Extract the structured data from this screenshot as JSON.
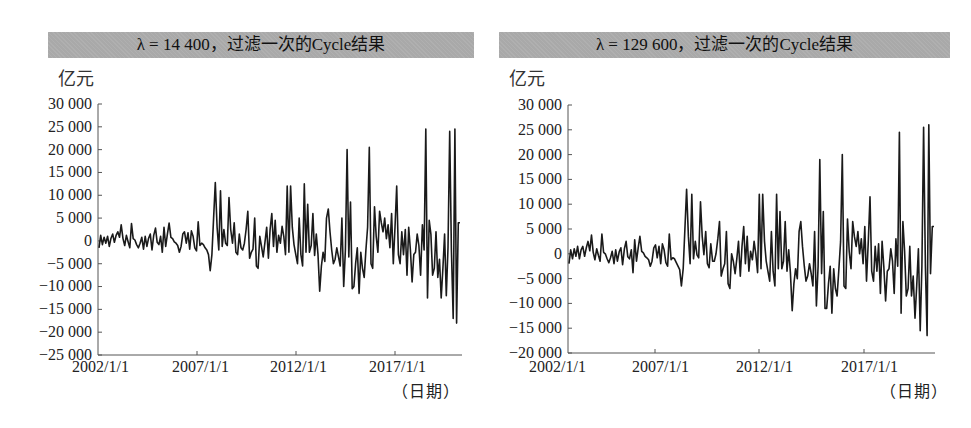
{
  "chart_data": [
    {
      "type": "line",
      "title": "λ = 14 400，过滤一次的Cycle结果",
      "ylabel": "亿元",
      "xlabel": "（日期）",
      "ylim": [
        -25000,
        30000
      ],
      "yticks": [
        30000,
        25000,
        20000,
        15000,
        10000,
        5000,
        0,
        -5000,
        -10000,
        -15000,
        -20000,
        -25000
      ],
      "ytick_labels": [
        "30 000",
        "25 000",
        "20 000",
        "15 000",
        "10 000",
        "5 000",
        "0",
        "−5 000",
        "−10 000",
        "−15 000",
        "−20 000",
        "−25 000"
      ],
      "xtick_labels": [
        "2002/1/1",
        "2007/1/1",
        "2012/1/1",
        "2017/1/1"
      ],
      "grid": false,
      "legend": null,
      "series": [
        {
          "name": "Cycle",
          "x_start": "2002/1/1",
          "x_step": "1 month",
          "values": [
            -1500,
            1200,
            -800,
            800,
            -500,
            1000,
            -1200,
            600,
            1500,
            -300,
            1200,
            2000,
            800,
            3500,
            500,
            -1000,
            1200,
            -200,
            -1500,
            3800,
            500,
            200,
            -800,
            -1500,
            -500,
            800,
            -1800,
            1000,
            -1200,
            600,
            1500,
            -2000,
            1200,
            2800,
            -300,
            -800,
            1000,
            -2500,
            3000,
            -1200,
            1500,
            3900,
            800,
            500,
            -200,
            -500,
            -1000,
            -2500,
            -1200,
            1500,
            2000,
            -500,
            1800,
            -1800,
            2200,
            1000,
            -1500,
            -2200,
            4200,
            -1000,
            -500,
            -800,
            -1500,
            -2000,
            -3000,
            -6500,
            -3000,
            5000,
            12800,
            3000,
            -2000,
            11000,
            -1200,
            2500,
            -500,
            -1000,
            9500,
            2500,
            -500,
            4000,
            -2500,
            -3000,
            1500,
            -1500,
            -2000,
            -500,
            2500,
            6500,
            -3800,
            -2500,
            -1800,
            5000,
            -5500,
            -6000,
            1000,
            -1200,
            -3500,
            -200,
            3000,
            -3800,
            2500,
            6000,
            -1200,
            4500,
            -2500,
            1200,
            -500,
            3200,
            1000,
            -3000,
            12000,
            -2500,
            12000,
            3000,
            -800,
            -3000,
            -5000,
            5000,
            -3000,
            -5500,
            12500,
            -2500,
            8000,
            -2500,
            -1000,
            6000,
            -3200,
            1500,
            -3000,
            -11000,
            -5500,
            -2500,
            -4500,
            5000,
            7000,
            2000,
            -2000,
            -5000,
            -4000,
            -1500,
            -3500,
            -5500,
            5000,
            -10000,
            -2000,
            20000,
            -3500,
            8500,
            -10500,
            -10000,
            -5000,
            -1500,
            -11500,
            -2500,
            -6000,
            -8000,
            -2000,
            3000,
            20500,
            -5000,
            -6000,
            7500,
            1000,
            -2500,
            6500,
            4000,
            2000,
            5000,
            500,
            3500,
            -1500,
            6000,
            -5000,
            3000,
            12000,
            -3000,
            -5000,
            2000,
            -3000,
            2500,
            -7500,
            3000,
            -2000,
            -9000,
            -3000,
            -2500,
            1500,
            -1000,
            -7500,
            3500,
            -2000,
            24500,
            -12500,
            4500,
            1500,
            -7500,
            -6000,
            2000,
            -8000,
            -4000,
            -12500,
            -6000,
            1500,
            -12000,
            -1500,
            24000,
            -2000,
            -17000,
            24500,
            -18000,
            4000,
            4000
          ]
        }
      ]
    },
    {
      "type": "line",
      "title": "λ = 129 600，过滤一次的Cycle结果",
      "ylabel": "亿元",
      "xlabel": "（日期）",
      "ylim": [
        -20000,
        30000
      ],
      "yticks": [
        30000,
        25000,
        20000,
        15000,
        10000,
        5000,
        0,
        -5000,
        -10000,
        -15000,
        -20000
      ],
      "ytick_labels": [
        "30 000",
        "25 000",
        "20 000",
        "15 000",
        "10 000",
        "5 000",
        "0",
        "−5 000",
        "−10 000",
        "−15 000",
        "−20 000"
      ],
      "xtick_labels": [
        "2002/1/1",
        "2007/1/1",
        "2012/1/1",
        "2017/1/1"
      ],
      "grid": false,
      "legend": null,
      "series": [
        {
          "name": "Cycle",
          "x_start": "2002/1/1",
          "x_step": "1 month",
          "values": [
            -2000,
            800,
            -1000,
            1000,
            -500,
            1500,
            -1000,
            800,
            1500,
            -500,
            1200,
            2500,
            600,
            3800,
            300,
            -1200,
            1000,
            -300,
            -1500,
            4000,
            300,
            0,
            -1000,
            -1800,
            -800,
            500,
            -2000,
            800,
            -1500,
            400,
            1200,
            -2200,
            1000,
            2500,
            -600,
            -1000,
            800,
            -3800,
            2800,
            -1500,
            1200,
            3500,
            500,
            200,
            -500,
            -800,
            -1200,
            -2500,
            -1500,
            1200,
            1800,
            -800,
            1500,
            -2000,
            2000,
            800,
            -1800,
            -2500,
            4000,
            -1200,
            -800,
            -1000,
            -1800,
            -2500,
            -3200,
            -6500,
            -3000,
            5000,
            13000,
            3500,
            -2000,
            12000,
            -1000,
            2500,
            -200,
            -800,
            10500,
            3500,
            -200,
            4500,
            -2000,
            -2800,
            2000,
            -1500,
            -1500,
            0,
            3000,
            6500,
            -4500,
            -3000,
            -2000,
            4500,
            -6000,
            -7000,
            0,
            -1500,
            -4000,
            -1000,
            2500,
            -4500,
            1500,
            5500,
            -2000,
            3500,
            -3500,
            500,
            -1200,
            2500,
            0,
            -3800,
            12000,
            -3000,
            12000,
            2500,
            -1500,
            -3500,
            -5500,
            4500,
            -3500,
            -6500,
            12000,
            -3000,
            8500,
            -3000,
            -1500,
            6500,
            -3500,
            800,
            -3800,
            -11500,
            -6000,
            -3000,
            -5000,
            4500,
            6500,
            1500,
            -2500,
            -5500,
            -4500,
            -2000,
            -4000,
            -6500,
            4500,
            -10500,
            -2500,
            19000,
            -4000,
            8500,
            -11000,
            -11000,
            -6000,
            -2500,
            -12000,
            -3000,
            -7000,
            -8500,
            -3000,
            2500,
            20000,
            -6500,
            -7000,
            7000,
            500,
            -3000,
            6500,
            3500,
            1500,
            4500,
            0,
            3000,
            -2000,
            5500,
            -5500,
            2500,
            11500,
            -3500,
            -5500,
            1500,
            -3500,
            2000,
            -8000,
            2500,
            -2500,
            -9500,
            -3500,
            -3000,
            1000,
            -1500,
            -8000,
            3000,
            -2500,
            24500,
            -12000,
            6500,
            500,
            -8500,
            -7000,
            1500,
            -8500,
            -4500,
            -13000,
            -6500,
            1000,
            -15500,
            -2500,
            25500,
            -2500,
            -16500,
            26000,
            -4000,
            5500,
            5500
          ]
        }
      ]
    }
  ],
  "panels": [
    {
      "title": "λ = 14 400，过滤一次的Cycle结果",
      "unit": "亿元",
      "xunit": "（日期）",
      "ytick_labels": [
        "30 000",
        "25 000",
        "20 000",
        "15 000",
        "10 000",
        "5 000",
        "0",
        "−5 000",
        "−10 000",
        "−15 000",
        "−20 000",
        "−25 000"
      ],
      "xtick_labels": [
        "2002/1/1",
        "2007/1/1",
        "2012/1/1",
        "2017/1/1"
      ]
    },
    {
      "title": "λ = 129 600，过滤一次的Cycle结果",
      "unit": "亿元",
      "xunit": "（日期）",
      "ytick_labels": [
        "30 000",
        "25 000",
        "20 000",
        "15 000",
        "10 000",
        "5 000",
        "0",
        "−5 000",
        "−10 000",
        "−15 000",
        "−20 000"
      ],
      "xtick_labels": [
        "2002/1/1",
        "2007/1/1",
        "2012/1/1",
        "2017/1/1"
      ]
    }
  ],
  "colors": {
    "line": "#1a1a1a",
    "axis": "#555555",
    "title_bar": "#a9a9a9"
  }
}
